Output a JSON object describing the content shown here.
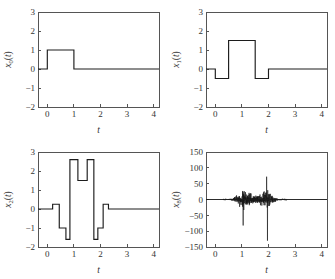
{
  "figure": {
    "title": "",
    "background": "#ffffff",
    "trace_color": "#1c1c1c",
    "axis_color": "#555555",
    "layout": "2x2 grid of line plots"
  },
  "chart_data": [
    {
      "id": "panel-0",
      "type": "line",
      "title": "",
      "xlabel": "t",
      "ylabel": "x0(t)",
      "ylabel_base": "x",
      "ylabel_sub": "0",
      "ylabel_arg": "(t)",
      "xlim": [
        -0.35,
        4.2
      ],
      "ylim": [
        -2,
        3
      ],
      "xticks": [
        0,
        1,
        2,
        3,
        4
      ],
      "xticklabels": [
        "0",
        "1",
        "2",
        "3",
        "4"
      ],
      "yticks": [
        -2,
        -1,
        0,
        1,
        2,
        3
      ],
      "yticklabels": [
        "-2",
        "-1",
        "0",
        "1",
        "2",
        "3"
      ],
      "grid": false,
      "legend": null,
      "description": "unit rectangular pulse of amplitude 1 from t=0 to t=1",
      "x": [
        -0.35,
        0.0,
        0.0,
        1.0,
        1.0,
        4.2
      ],
      "y": [
        0,
        0,
        1,
        1,
        0,
        0
      ]
    },
    {
      "id": "panel-1",
      "type": "line",
      "title": "",
      "xlabel": "t",
      "ylabel": "x1(t)",
      "ylabel_base": "x",
      "ylabel_sub": "1",
      "ylabel_arg": "(t)",
      "xlim": [
        -0.35,
        4.2
      ],
      "ylim": [
        -2,
        3
      ],
      "xticks": [
        0,
        1,
        2,
        3,
        4
      ],
      "xticklabels": [
        "0",
        "1",
        "2",
        "3",
        "4"
      ],
      "yticks": [
        -2,
        -1,
        0,
        1,
        2,
        3
      ],
      "yticklabels": [
        "-2",
        "-1",
        "0",
        "1",
        "2",
        "3"
      ],
      "grid": false,
      "legend": null,
      "description": "piecewise-constant wavelet: -0.5 on [0,0.5], +1.5 on [0.5,1.5], -0.5 on [1.5,2], 0 elsewhere",
      "x": [
        -0.35,
        0.0,
        0.0,
        0.5,
        0.5,
        1.5,
        1.5,
        2.0,
        2.0,
        4.2
      ],
      "y": [
        0,
        0,
        -0.5,
        -0.5,
        1.5,
        1.5,
        -0.5,
        -0.5,
        0,
        0
      ]
    },
    {
      "id": "panel-2",
      "type": "line",
      "title": "",
      "xlabel": "t",
      "ylabel": "x2(t)",
      "ylabel_base": "x",
      "ylabel_sub": "2",
      "ylabel_arg": "(t)",
      "xlim": [
        -0.35,
        4.2
      ],
      "ylim": [
        -2,
        3
      ],
      "xticks": [
        0,
        1,
        2,
        3,
        4
      ],
      "xticklabels": [
        "0",
        "1",
        "2",
        "3",
        "4"
      ],
      "yticks": [
        -2,
        -1,
        0,
        1,
        2,
        3
      ],
      "yticklabels": [
        "-2",
        "-1",
        "0",
        "1",
        "2",
        "3"
      ],
      "grid": false,
      "legend": null,
      "description": "symmetric piecewise-constant waveform with levels 0.25, -1, -1.6, 2.6, 1.5, 2.6, -1.6, -1, 0.25",
      "x": [
        -0.35,
        0.2,
        0.2,
        0.45,
        0.45,
        0.7,
        0.7,
        0.85,
        0.85,
        1.15,
        1.15,
        1.5,
        1.5,
        1.75,
        1.75,
        1.9,
        1.9,
        2.1,
        2.1,
        2.3,
        2.3,
        4.2
      ],
      "y": [
        0,
        0,
        0.25,
        0.25,
        -1.0,
        -1.0,
        -1.6,
        -1.6,
        2.6,
        2.6,
        1.5,
        1.5,
        2.6,
        2.6,
        -1.6,
        -1.6,
        -1.0,
        -1.0,
        0.25,
        0.25,
        0,
        0
      ]
    },
    {
      "id": "panel-3",
      "type": "line",
      "title": "",
      "xlabel": "t",
      "ylabel": "x8(t)",
      "ylabel_base": "x",
      "ylabel_sub": "8",
      "ylabel_arg": "(t)",
      "xlim": [
        -0.35,
        4.2
      ],
      "ylim": [
        -150,
        150
      ],
      "xticks": [
        0,
        1,
        2,
        3,
        4
      ],
      "xticklabels": [
        "0",
        "1",
        "2",
        "3",
        "4"
      ],
      "yticks": [
        -150,
        -100,
        -50,
        0,
        50,
        100,
        150
      ],
      "yticklabels": [
        "-150",
        "-100",
        "-50",
        "0",
        "50",
        "100",
        "150"
      ],
      "grid": false,
      "legend": null,
      "description": "high-frequency oscillatory detail signal concentrated on 0.3<t<2.7 with two dominant spikes: +130 near t=1.05 and -130 near t=1.95",
      "noise_support": [
        0.3,
        2.7
      ],
      "spikes": [
        {
          "t": 1.05,
          "amplitude": 130
        },
        {
          "t": 1.05,
          "amplitude": -82
        },
        {
          "t": 1.93,
          "amplitude": 72
        },
        {
          "t": 1.96,
          "amplitude": -130
        }
      ],
      "typical_amplitude": 18
    }
  ]
}
